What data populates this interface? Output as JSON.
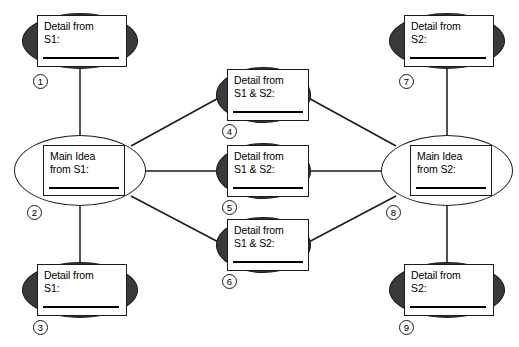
{
  "diagram": {
    "title_sliver": "",
    "nodes": [
      {
        "id": "1",
        "badge": "1",
        "line1": "Detail from",
        "line2": "S1:",
        "style": "filled",
        "role": "detail-s1"
      },
      {
        "id": "2",
        "badge": "2",
        "line1": "Main Idea",
        "line2": "from S1:",
        "style": "open",
        "role": "main-idea-s1"
      },
      {
        "id": "3",
        "badge": "3",
        "line1": "Detail from",
        "line2": "S1:",
        "style": "filled",
        "role": "detail-s1"
      },
      {
        "id": "4",
        "badge": "4",
        "line1": "Detail from",
        "line2": "S1 & S2:",
        "style": "filled",
        "role": "detail-shared"
      },
      {
        "id": "5",
        "badge": "5",
        "line1": "Detail from",
        "line2": "S1 & S2:",
        "style": "filled",
        "role": "detail-shared"
      },
      {
        "id": "6",
        "badge": "6",
        "line1": "Detail from",
        "line2": "S1 & S2:",
        "style": "filled",
        "role": "detail-shared"
      },
      {
        "id": "7",
        "badge": "7",
        "line1": "Detail from",
        "line2": "S2:",
        "style": "filled",
        "role": "detail-s2"
      },
      {
        "id": "8",
        "badge": "8",
        "line1": "Main Idea",
        "line2": "from S2:",
        "style": "open",
        "role": "main-idea-s2"
      },
      {
        "id": "9",
        "badge": "9",
        "line1": "Detail from",
        "line2": "S2:",
        "style": "filled",
        "role": "detail-s2"
      }
    ],
    "edges": [
      {
        "from": "1",
        "to": "2"
      },
      {
        "from": "2",
        "to": "3"
      },
      {
        "from": "2",
        "to": "4"
      },
      {
        "from": "2",
        "to": "5"
      },
      {
        "from": "2",
        "to": "6"
      },
      {
        "from": "4",
        "to": "8"
      },
      {
        "from": "5",
        "to": "8"
      },
      {
        "from": "6",
        "to": "8"
      },
      {
        "from": "7",
        "to": "8"
      },
      {
        "from": "8",
        "to": "9"
      }
    ],
    "colors": {
      "fill_dark": "#3a3a3c",
      "fill_open": "#ffffff",
      "stroke": "#1a1a1a",
      "text": "#000000",
      "background": "#ffffff"
    }
  }
}
